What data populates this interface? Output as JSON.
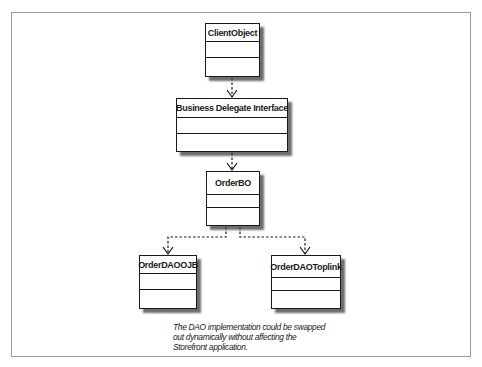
{
  "diagram": {
    "type": "UML class diagram",
    "classes": [
      {
        "id": "client",
        "name": "ClientObject"
      },
      {
        "id": "delegate",
        "name": "Business Delegate Interface"
      },
      {
        "id": "bo",
        "name": "OrderBO"
      },
      {
        "id": "ojb",
        "name": "OrderDAOOJB"
      },
      {
        "id": "toplink",
        "name": "OrderDAOToplink"
      }
    ],
    "relationships": [
      {
        "from": "ClientObject",
        "to": "Business Delegate Interface",
        "style": "dashed",
        "arrow": "open"
      },
      {
        "from": "Business Delegate Interface",
        "to": "OrderBO",
        "style": "dashed",
        "arrow": "open"
      },
      {
        "from": "OrderBO",
        "to": "OrderDAOOJB",
        "style": "dashed",
        "arrow": "open"
      },
      {
        "from": "OrderBO",
        "to": "OrderDAOToplink",
        "style": "dashed",
        "arrow": "open"
      }
    ],
    "caption": {
      "lines": [
        "The DAO implementation could be swapped",
        "out dynamically without affecting the",
        "Storefront application."
      ]
    }
  },
  "colors": {
    "line": "#1a1a1a",
    "frame": "#9a9a9a",
    "shadow": "#3c3c3c",
    "background": "#ffffff"
  }
}
